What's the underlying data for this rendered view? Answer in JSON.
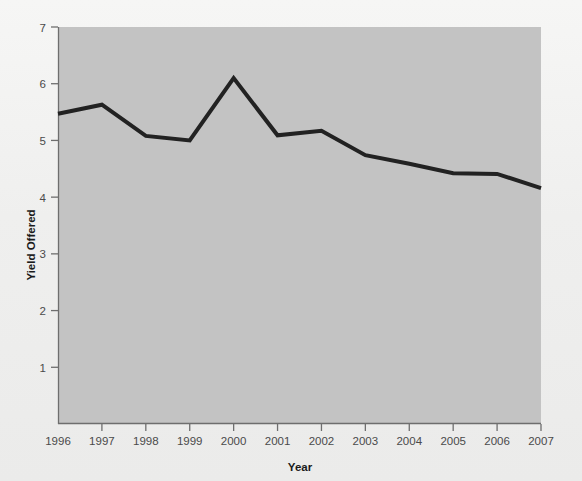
{
  "chart_data": {
    "type": "line",
    "title": "",
    "subtitle": "",
    "xlabel": "Year",
    "ylabel": "Yield Offered",
    "categories": [
      "1996",
      "1997",
      "1998",
      "1999",
      "2000",
      "2001",
      "2002",
      "2003",
      "2004",
      "2005",
      "2006",
      "2007"
    ],
    "x": [
      1996,
      1997,
      1998,
      1999,
      2000,
      2001,
      2002,
      2003,
      2004,
      2005,
      2006,
      2007
    ],
    "values": [
      5.47,
      5.63,
      5.08,
      5.0,
      6.1,
      5.09,
      5.17,
      4.74,
      4.59,
      4.42,
      4.41,
      4.16
    ],
    "series": [
      {
        "name": "Yield Offered",
        "values": [
          5.47,
          5.63,
          5.08,
          5.0,
          6.1,
          5.09,
          5.17,
          4.74,
          4.59,
          4.42,
          4.41,
          4.16
        ]
      }
    ],
    "ylim": [
      0,
      7
    ],
    "xlim": [
      1996,
      2007
    ],
    "ytick_labels": [
      "1",
      "2",
      "3",
      "4",
      "5",
      "6",
      "7"
    ],
    "ytick_values": [
      1,
      2,
      3,
      4,
      5,
      6,
      7
    ],
    "xtick_labels": [
      "1996",
      "1997",
      "1998",
      "1999",
      "2000",
      "2001",
      "2002",
      "2003",
      "2004",
      "2005",
      "2006",
      "2007"
    ],
    "grid": false,
    "legend": "none",
    "colors": {
      "line": "#222222",
      "plot_background": "#c3c3c3",
      "figure_background": "#f1f1f0",
      "axis": "#6e6e6e",
      "tick_label": "#4a4a4a",
      "axis_title": "#1b1b1b"
    },
    "line_width": 4
  }
}
